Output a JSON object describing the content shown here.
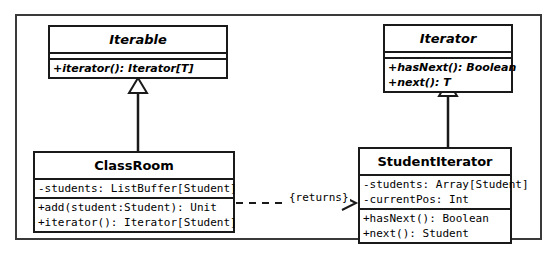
{
  "diagram": {
    "type": "uml-class-diagram",
    "colors": {
      "background": "#ffffff",
      "stroke": "#1a1a1a",
      "frame": "#3a3a3a",
      "text": "#000000"
    }
  },
  "classes": {
    "iterable": {
      "name": "Iterable",
      "stereotype": "interface",
      "abstract": true,
      "attributes": [],
      "methods": [
        "+iterator(): Iterator[T]"
      ]
    },
    "iterator": {
      "name": "Iterator",
      "stereotype": "interface",
      "abstract": true,
      "attributes": [],
      "methods": [
        "+hasNext(): Boolean",
        "+next(): T"
      ]
    },
    "classroom": {
      "name": "ClassRoom",
      "stereotype": "class",
      "abstract": false,
      "attributes": [
        "-students: ListBuffer[Student]"
      ],
      "methods": [
        "+add(student:Student): Unit",
        "+iterator(): Iterator[Student]"
      ]
    },
    "studentiterator": {
      "name": "StudentIterator",
      "stereotype": "class",
      "abstract": false,
      "attributes": [
        "-students: Array[Student]",
        "-currentPos: Int"
      ],
      "methods": [
        "+hasNext(): Boolean",
        "+next(): Student"
      ]
    }
  },
  "relationships": [
    {
      "id": "classroom-implements-iterable",
      "kind": "generalization",
      "from": "ClassRoom",
      "to": "Iterable",
      "label": ""
    },
    {
      "id": "studentiterator-implements-iterator",
      "kind": "generalization",
      "from": "StudentIterator",
      "to": "Iterator",
      "label": ""
    },
    {
      "id": "classroom-returns-studentiterator",
      "kind": "dependency",
      "from": "ClassRoom",
      "to": "StudentIterator",
      "label": "{returns}"
    }
  ]
}
